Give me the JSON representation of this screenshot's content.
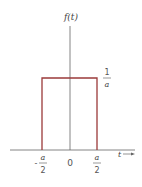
{
  "diagram": {
    "type": "rectangular pulse",
    "y_label": "f(t)",
    "x_label": "t",
    "height_label": {
      "numerator": "1",
      "denominator": "a"
    },
    "x_ticks": [
      {
        "sign": "-",
        "numerator": "a",
        "denominator": "2"
      },
      {
        "value": "0"
      },
      {
        "sign": "",
        "numerator": "a",
        "denominator": "2"
      }
    ],
    "colors": {
      "pulse": "#9b3a3a",
      "axes": "#555555",
      "text": "#444444"
    }
  }
}
